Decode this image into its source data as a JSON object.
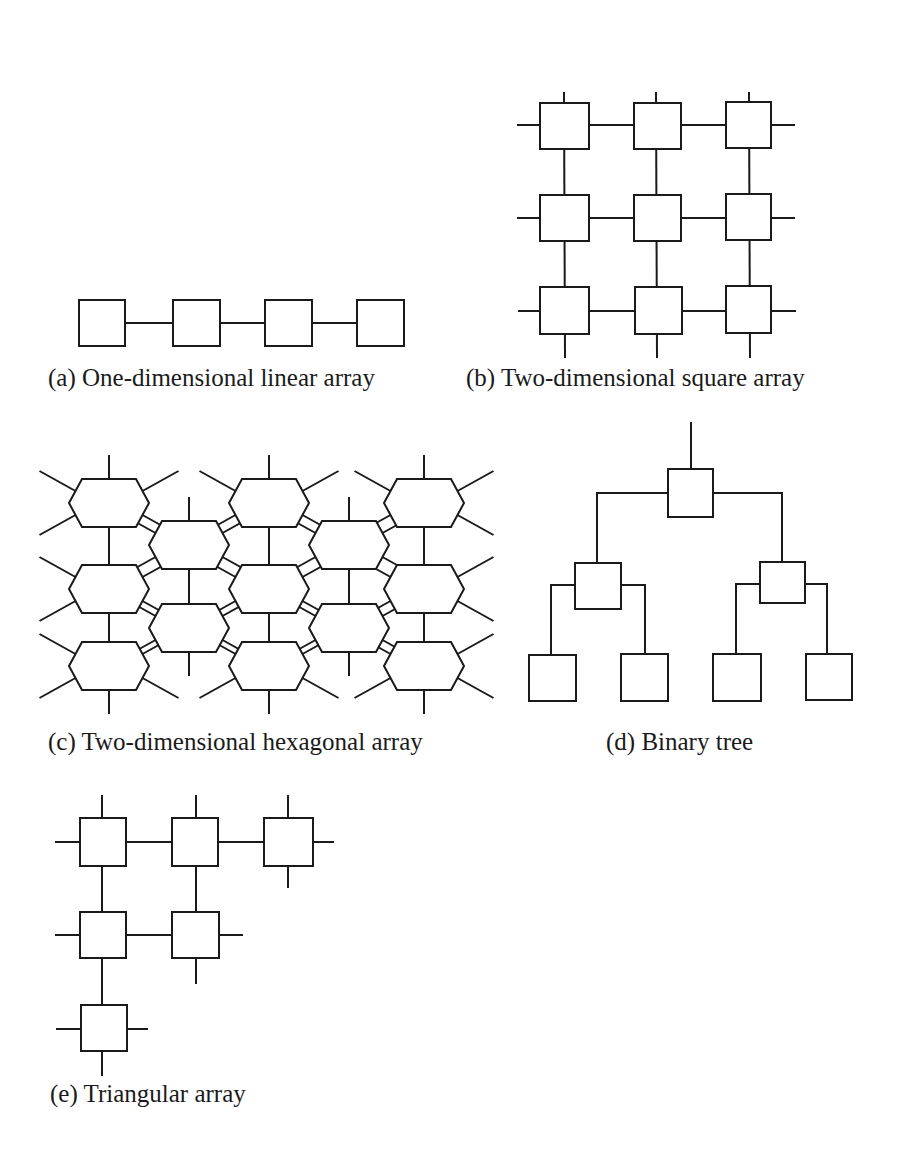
{
  "figure": {
    "panels": [
      {
        "id": "a",
        "caption": "(a) One-dimensional linear array",
        "nodes": 4,
        "shape": "square"
      },
      {
        "id": "b",
        "caption": "(b) Two-dimensional square array",
        "nodes": 9,
        "rows": 3,
        "cols": 3,
        "shape": "square"
      },
      {
        "id": "c",
        "caption": "(c) Two-dimensional hexagonal array",
        "nodes": 13,
        "shape": "hexagon"
      },
      {
        "id": "d",
        "caption": "(d) Binary tree",
        "nodes": 7,
        "levels": 3,
        "shape": "square"
      },
      {
        "id": "e",
        "caption": "(e) Triangular array",
        "nodes": 6,
        "shape": "square"
      }
    ]
  }
}
